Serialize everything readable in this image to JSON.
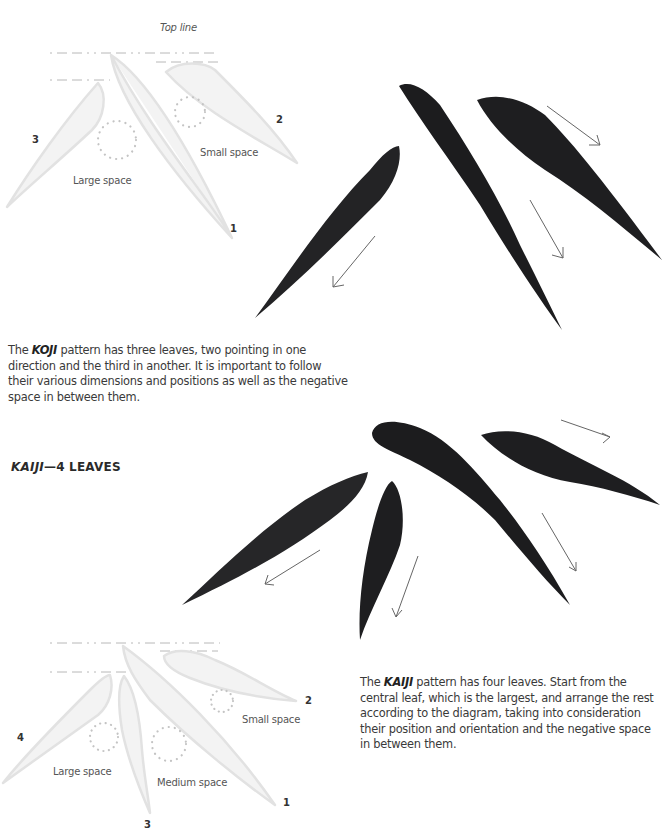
{
  "koji": {
    "diagram": {
      "top_line_label": "Top line",
      "leaf_numbers": [
        "1",
        "2",
        "3"
      ],
      "spaces": {
        "large": "Large space",
        "small": "Small space"
      }
    },
    "description": {
      "prefix": "The ",
      "pattern_name": "KOJI",
      "text": " pattern has three leaves, two pointing in one direction and the third in another. It is important to follow their various dimensions and positions as well as the negative space in between them."
    },
    "brush_leaves": 3
  },
  "kaiji": {
    "heading": {
      "name": "KAIJI",
      "suffix": "—4 LEAVES"
    },
    "diagram": {
      "leaf_numbers": [
        "1",
        "2",
        "3",
        "4"
      ],
      "spaces": {
        "large": "Large space",
        "medium": "Medium space",
        "small": "Small space"
      }
    },
    "description": {
      "prefix": "The ",
      "pattern_name": "KAIJI",
      "text": " pattern has four leaves. Start from the central leaf, which is the largest, and arrange the rest according to the diagram, taking into consideration their position and orientation and the negative space in between them."
    },
    "brush_leaves": 4
  },
  "colors": {
    "ink": "#1c1c1e",
    "diagram_leaf_fill": "#f4f4f4",
    "diagram_leaf_stroke": "#e0e0e0",
    "guide_line": "#b5b5b5",
    "dot_circle": "#c4c4c4",
    "arrow": "#666666"
  }
}
